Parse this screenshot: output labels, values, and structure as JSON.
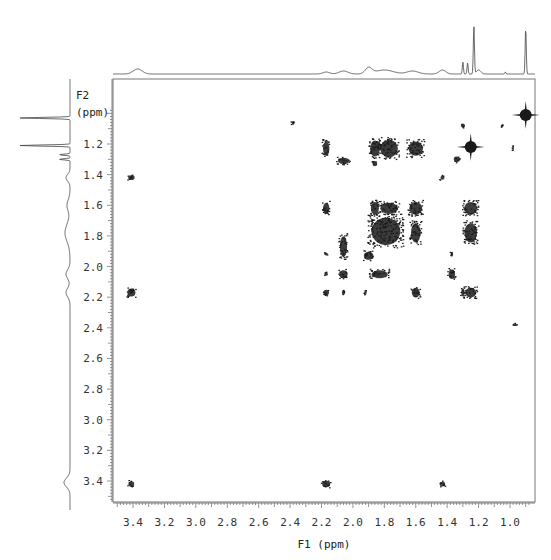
{
  "chart_data": {
    "type": "heatmap",
    "subtype": "2D NMR COSY contour plot",
    "title": "",
    "xlabel": "F1 (ppm)",
    "ylabel_line1": "F2",
    "ylabel_line2": "(ppm)",
    "xlim": [
      3.53,
      0.86
    ],
    "ylim": [
      0.98,
      3.55
    ],
    "x_ticks": [
      3.4,
      3.2,
      3.0,
      2.8,
      2.6,
      2.4,
      2.2,
      2.0,
      1.8,
      1.6,
      1.4,
      1.2,
      1.0
    ],
    "x_tick_labels": [
      "3.4",
      "3.2",
      "3.0",
      "2.8",
      "2.6",
      "2.4",
      "2.2",
      "2.0",
      "1.8",
      "1.6",
      "1.4",
      "1.2",
      "1.0"
    ],
    "y_ticks": [
      1.2,
      1.4,
      1.6,
      1.8,
      2.0,
      2.2,
      2.4,
      2.6,
      2.8,
      3.0,
      3.2,
      3.4
    ],
    "y_tick_labels": [
      "1.2",
      "1.4",
      "1.6",
      "1.8",
      "2.0",
      "2.2",
      "2.4",
      "2.6",
      "2.8",
      "3.0",
      "3.2",
      "3.4"
    ],
    "grid": false,
    "legend": "none",
    "projection_1d_top": "1H spectrum along F1",
    "projection_1d_left": "1H spectrum along F2",
    "diagonal_peaks": [
      {
        "x": 3.41,
        "y": 3.42,
        "size": 7
      },
      {
        "x": 2.17,
        "y": 2.17,
        "size": 7
      },
      {
        "x": 1.43,
        "y": 1.42,
        "size": 5
      },
      {
        "x": 1.34,
        "y": 1.3,
        "size": 7
      },
      {
        "x": 1.25,
        "y": 1.22,
        "size": 10,
        "shape": "cross"
      },
      {
        "x": 1.05,
        "y": 1.08,
        "size": 3
      },
      {
        "x": 0.9,
        "y": 1.01,
        "size": 10,
        "shape": "cross"
      }
    ],
    "cross_peaks": [
      {
        "x": 3.41,
        "y": 1.42,
        "w": 8,
        "h": 6
      },
      {
        "x": 3.41,
        "y": 2.17,
        "w": 10,
        "h": 10
      },
      {
        "x": 2.17,
        "y": 3.42,
        "w": 10,
        "h": 8
      },
      {
        "x": 1.43,
        "y": 3.42,
        "w": 7,
        "h": 6
      },
      {
        "x": 2.38,
        "y": 1.06,
        "w": 4,
        "h": 4
      },
      {
        "x": 2.17,
        "y": 1.23,
        "w": 8,
        "h": 18
      },
      {
        "x": 2.06,
        "y": 1.31,
        "w": 14,
        "h": 8
      },
      {
        "x": 1.86,
        "y": 1.23,
        "w": 12,
        "h": 20
      },
      {
        "x": 1.77,
        "y": 1.23,
        "w": 22,
        "h": 22
      },
      {
        "x": 1.6,
        "y": 1.23,
        "w": 18,
        "h": 18
      },
      {
        "x": 1.86,
        "y": 1.33,
        "w": 6,
        "h": 6
      },
      {
        "x": 2.17,
        "y": 1.62,
        "w": 8,
        "h": 14
      },
      {
        "x": 1.86,
        "y": 1.62,
        "w": 10,
        "h": 16
      },
      {
        "x": 1.77,
        "y": 1.62,
        "w": 22,
        "h": 14
      },
      {
        "x": 1.6,
        "y": 1.62,
        "w": 16,
        "h": 16
      },
      {
        "x": 1.25,
        "y": 1.62,
        "w": 16,
        "h": 16
      },
      {
        "x": 1.79,
        "y": 1.77,
        "w": 36,
        "h": 34
      },
      {
        "x": 1.6,
        "y": 1.78,
        "w": 12,
        "h": 24
      },
      {
        "x": 1.25,
        "y": 1.78,
        "w": 16,
        "h": 24
      },
      {
        "x": 2.06,
        "y": 1.87,
        "w": 9,
        "h": 26
      },
      {
        "x": 1.9,
        "y": 1.93,
        "w": 12,
        "h": 10
      },
      {
        "x": 2.17,
        "y": 1.92,
        "w": 4,
        "h": 3
      },
      {
        "x": 1.37,
        "y": 1.92,
        "w": 3,
        "h": 6
      },
      {
        "x": 2.06,
        "y": 2.05,
        "w": 10,
        "h": 10
      },
      {
        "x": 1.83,
        "y": 2.05,
        "w": 20,
        "h": 10
      },
      {
        "x": 1.37,
        "y": 2.05,
        "w": 8,
        "h": 12
      },
      {
        "x": 2.17,
        "y": 2.05,
        "w": 4,
        "h": 4
      },
      {
        "x": 2.06,
        "y": 2.17,
        "w": 4,
        "h": 6
      },
      {
        "x": 1.92,
        "y": 2.17,
        "w": 3,
        "h": 6
      },
      {
        "x": 1.6,
        "y": 2.17,
        "w": 10,
        "h": 12
      },
      {
        "x": 1.25,
        "y": 2.17,
        "w": 14,
        "h": 12
      },
      {
        "x": 1.3,
        "y": 2.17,
        "w": 4,
        "h": 10
      },
      {
        "x": 0.98,
        "y": 1.23,
        "w": 2,
        "h": 6
      },
      {
        "x": 1.3,
        "y": 1.08,
        "w": 5,
        "h": 5
      },
      {
        "x": 0.97,
        "y": 2.38,
        "w": 5,
        "h": 3
      }
    ],
    "top_projection_peaks": [
      {
        "x": 3.37,
        "h": 5,
        "w": 0.04
      },
      {
        "x": 2.17,
        "h": 2,
        "w": 0.03
      },
      {
        "x": 2.06,
        "h": 3,
        "w": 0.04
      },
      {
        "x": 1.9,
        "h": 6,
        "w": 0.03
      },
      {
        "x": 1.8,
        "h": 4,
        "w": 0.08
      },
      {
        "x": 1.62,
        "h": 3,
        "w": 0.05
      },
      {
        "x": 1.43,
        "h": 4,
        "w": 0.03
      },
      {
        "x": 1.3,
        "h": 12,
        "w": 0.005
      },
      {
        "x": 1.27,
        "h": 11,
        "w": 0.005
      },
      {
        "x": 1.23,
        "h": 48,
        "w": 0.005
      },
      {
        "x": 1.2,
        "h": 4,
        "w": 0.02
      },
      {
        "x": 1.03,
        "h": 2,
        "w": 0.005
      },
      {
        "x": 0.9,
        "h": 46,
        "w": 0.005
      }
    ],
    "left_projection_peaks": [
      {
        "y": 1.03,
        "h": 50,
        "w": 0.005
      },
      {
        "y": 1.21,
        "h": 50,
        "w": 0.005
      },
      {
        "y": 1.27,
        "h": 11,
        "w": 0.005
      },
      {
        "y": 1.3,
        "h": 11,
        "w": 0.005
      },
      {
        "y": 1.42,
        "h": 4,
        "w": 0.03
      },
      {
        "y": 1.6,
        "h": 3,
        "w": 0.05
      },
      {
        "y": 1.78,
        "h": 5,
        "w": 0.08
      },
      {
        "y": 2.05,
        "h": 4,
        "w": 0.04
      },
      {
        "y": 2.17,
        "h": 4,
        "w": 0.04
      },
      {
        "y": 3.41,
        "h": 6,
        "w": 0.04
      }
    ]
  },
  "colors": {
    "axis": "#666666",
    "contour": "#1a1a1a",
    "projection": "#444444",
    "background": "#ffffff"
  }
}
